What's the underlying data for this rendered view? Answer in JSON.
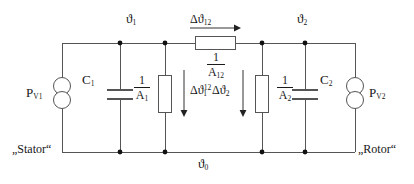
{
  "diagram": {
    "type": "electrical-thermal-equivalent-circuit",
    "line_color": "#555555",
    "text_color": "#161616",
    "node_color": "#111111"
  },
  "side_labels": {
    "left": "„Stator“",
    "right": "„Rotor“"
  },
  "node_labels": {
    "theta1": {
      "base": "ϑ",
      "sub": "1"
    },
    "theta2": {
      "base": "ϑ",
      "sub": "2"
    },
    "theta0": {
      "base": "ϑ",
      "sub": "0"
    }
  },
  "sources": [
    {
      "name": "source-left",
      "base": "P",
      "sub": "V1",
      "symbol": "current-source-double-circle"
    },
    {
      "name": "source-right",
      "base": "P",
      "sub": "V2",
      "symbol": "current-source-double-circle"
    }
  ],
  "capacitors": [
    {
      "name": "capacitor-c1",
      "base": "C",
      "sub": "1"
    },
    {
      "name": "capacitor-c2",
      "base": "C",
      "sub": "2"
    }
  ],
  "resistors": [
    {
      "name": "resistor-a1",
      "numerator": "1",
      "denominator": "A",
      "den_sub": "1",
      "orientation": "vertical"
    },
    {
      "name": "resistor-a12",
      "numerator": "1",
      "denominator": "A",
      "den_sub": "12",
      "orientation": "horizontal"
    },
    {
      "name": "resistor-a2",
      "numerator": "1",
      "denominator": "A",
      "den_sub": "2",
      "orientation": "vertical"
    }
  ],
  "flow_labels": [
    {
      "name": "delta-theta-12",
      "delta": "Δ",
      "base": "ϑ",
      "sub": "12",
      "sup": "",
      "direction": "right"
    },
    {
      "name": "delta-theta-1",
      "delta": "Δ",
      "base": "ϑ",
      "sub": "1",
      "sup": "12",
      "direction": "down"
    },
    {
      "name": "delta-theta-2",
      "delta": "Δ",
      "base": "ϑ",
      "sub": "2",
      "sup": "",
      "direction": "down"
    }
  ]
}
